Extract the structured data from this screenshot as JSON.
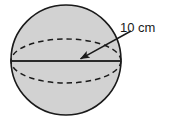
{
  "figure": {
    "kind": "geometry-diagram",
    "background_color": "#ffffff"
  },
  "sphere": {
    "fill_color": "#d2d2d2",
    "outline_color": "#1a1a1a",
    "center_x": 66,
    "center_y": 60,
    "radius": 55
  },
  "equator": {
    "style": "dashed",
    "stroke_color": "#1a1a1a",
    "rx": 55,
    "ry": 22,
    "center_x": 66,
    "center_y": 61
  },
  "diameter_line": {
    "style": "solid",
    "stroke_color": "#2b2b2b",
    "x1": 11,
    "y1": 61,
    "x2": 121,
    "y2": 61
  },
  "leader_arrow": {
    "stroke_color": "#1a1a1a",
    "start_x": 131,
    "start_y": 31,
    "end_x": 78,
    "end_y": 60,
    "arrowhead": "filled-triangle",
    "points_to": "diameter-line"
  },
  "annotation": {
    "measure_label": "10 cm",
    "value": 10,
    "unit": "cm",
    "quantity": "diameter"
  }
}
